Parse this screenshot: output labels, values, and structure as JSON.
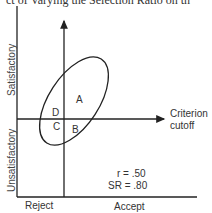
{
  "caption": "ct of Varying the Selection Ratio on th",
  "diagram": {
    "y_axis_labels": {
      "top": "Satisfactory",
      "bottom": "Unsatisfactory"
    },
    "x_axis_labels": {
      "left": "Reject",
      "right": "Accept"
    },
    "cutoff_label_line1": "Criterion",
    "cutoff_label_line2": "cutoff",
    "regions": {
      "A": "A",
      "B": "B",
      "C": "C",
      "D": "D"
    },
    "stats": {
      "r": "r  =  .50",
      "sr": "SR  =  .80"
    },
    "line_color": "#222222"
  }
}
